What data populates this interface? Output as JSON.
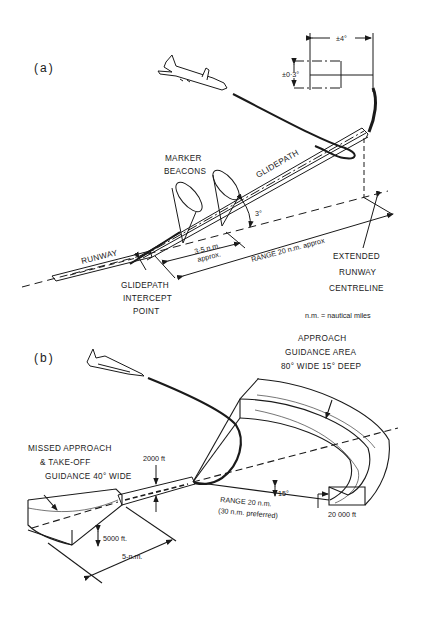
{
  "panel_a": {
    "label": "(a)",
    "dimension_lateral": "±4°",
    "dimension_vertical": "±0·3°",
    "glidepath": "GLIDEPATH",
    "marker_beacons_line1": "MARKER",
    "marker_beacons_line2": "BEACONS",
    "angle": "3°",
    "beacon_distance_line1": "3·5 n.m.",
    "beacon_distance_line2": "approx.",
    "range": "RANGE 20 n.m. approx",
    "runway": "RUNWAY",
    "intercept_line1": "GLIDEPATH",
    "intercept_line2": "INTERCEPT",
    "intercept_line3": "POINT",
    "centreline_line1": "EXTENDED",
    "centreline_line2": "RUNWAY",
    "centreline_line3": "CENTRELINE"
  },
  "legend": {
    "note": "n.m. = nautical miles"
  },
  "panel_b": {
    "label": "(b)",
    "approach_line1": "APPROACH",
    "approach_line2": "GUIDANCE AREA",
    "approach_line3": "80° WIDE 15° DEEP",
    "missed_line1": "MISSED APPROACH",
    "missed_line2": "& TAKE-OFF",
    "missed_line3": "GUIDANCE 40° WIDE",
    "height_runway": "2000 ft",
    "elevation_angle": "15°",
    "range_line1": "RANGE 20 n.m.",
    "range_line2": "(30 n.m. preferred)",
    "height_approach": "20 000 ft",
    "height_missed": "5000 ft.",
    "distance_missed": "5-n.m."
  }
}
